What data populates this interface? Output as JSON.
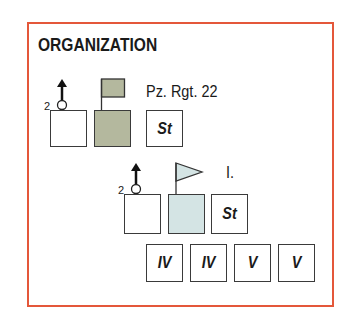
{
  "title": "ORGANIZATION",
  "colors": {
    "frame": "#e4573a",
    "regiment_fill": "#b4b89e",
    "battalion_fill": "#d4e4e4"
  },
  "regiment": {
    "label": "Pz. Rgt. 22",
    "motorized_count": "2",
    "staff_label": "St",
    "flag_icon": "square-flag-icon"
  },
  "battalion": {
    "label": "I.",
    "motorized_count": "2",
    "staff_label": "St",
    "flag_icon": "pennant-flag-icon"
  },
  "companies": [
    {
      "label": "IV"
    },
    {
      "label": "IV"
    },
    {
      "label": "V"
    },
    {
      "label": "V"
    }
  ]
}
